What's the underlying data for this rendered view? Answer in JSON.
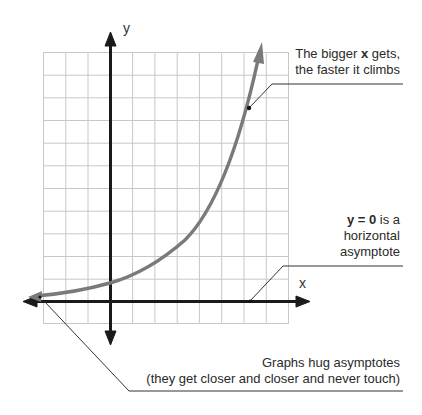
{
  "diagram": {
    "axes": {
      "x_label": "x",
      "y_label": "y"
    },
    "grid": {
      "columns": 11,
      "rows": 12,
      "origin_column": 3,
      "origin_row": 11,
      "line_color": "#c8c8c8"
    },
    "curve": {
      "type": "exponential growth",
      "color": "#7a7a7a",
      "y_intercept_units": 0.85
    },
    "annotations": {
      "top": {
        "line1_pre": "The bigger ",
        "line1_bold": "x",
        "line1_post": " gets,",
        "line2": "the faster it climbs"
      },
      "middle": {
        "line1_bold": "y = 0",
        "line1_post": " is a",
        "line2": "horizontal",
        "line3": "asymptote"
      },
      "bottom": {
        "line1": "Graphs hug asymptotes",
        "line2": "(they get closer and closer and never touch)"
      }
    },
    "colors": {
      "axis": "#1a1a1a",
      "curve": "#7a7a7a",
      "grid": "#c8c8c8",
      "text": "#2a2a2a",
      "leader": "#333333"
    }
  }
}
